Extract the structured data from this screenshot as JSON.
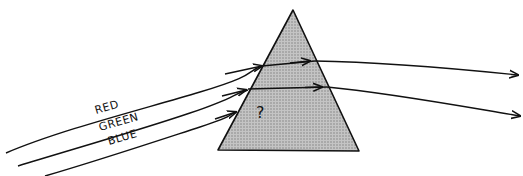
{
  "caption_partial": "",
  "prism": {
    "fill": "#b8b8b8",
    "stroke": "#111111",
    "unknown_symbol": "?"
  },
  "rays": [
    {
      "label": "RED"
    },
    {
      "label": "GREEN"
    },
    {
      "label": "BLUE"
    }
  ],
  "colors": {
    "line": "#111111",
    "background": "#ffffff"
  }
}
